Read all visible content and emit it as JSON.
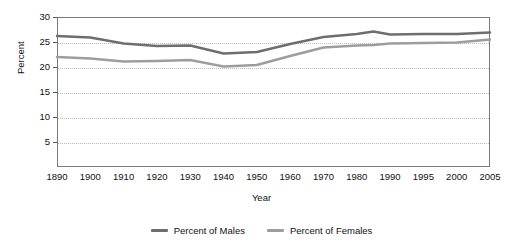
{
  "chart_data": {
    "type": "line",
    "title": "",
    "xlabel": "Year",
    "ylabel": "Percent",
    "ylim": [
      0,
      30
    ],
    "y_ticks": [
      5,
      10,
      15,
      20,
      25,
      30
    ],
    "grid": true,
    "legend_position": "bottom",
    "categories": [
      1890,
      1900,
      1910,
      1920,
      1930,
      1940,
      1950,
      1960,
      1970,
      1980,
      1990,
      1995,
      2000,
      2005
    ],
    "x_tick_labels": [
      "1890",
      "1900",
      "1910",
      "1920",
      "1930",
      "1940",
      "1950",
      "1960",
      "1970",
      "1980",
      "1990",
      "1995",
      "2000",
      "2005"
    ],
    "series": [
      {
        "name": "Percent of Males",
        "color": "#6e6e6e",
        "x": [
          1890,
          1900,
          1910,
          1920,
          1930,
          1940,
          1950,
          1960,
          1970,
          1980,
          1985,
          1990,
          1995,
          2000,
          2005
        ],
        "values": [
          26.2,
          25.9,
          24.7,
          24.2,
          24.3,
          22.7,
          23.0,
          24.6,
          26.0,
          26.6,
          27.1,
          26.5,
          26.6,
          26.6,
          26.9
        ]
      },
      {
        "name": "Percent of Females",
        "color": "#9d9d9d",
        "x": [
          1890,
          1900,
          1910,
          1920,
          1930,
          1940,
          1950,
          1960,
          1970,
          1980,
          1985,
          1990,
          1995,
          2000,
          2005
        ],
        "values": [
          22.0,
          21.7,
          21.1,
          21.2,
          21.4,
          20.1,
          20.4,
          22.2,
          23.9,
          24.3,
          24.4,
          24.7,
          24.8,
          24.9,
          25.5
        ]
      }
    ]
  },
  "legend": {
    "items": [
      {
        "label": "Percent of Males",
        "color": "#6e6e6e"
      },
      {
        "label": "Percent of Females",
        "color": "#9d9d9d"
      }
    ]
  },
  "axes": {
    "y_title": "Percent",
    "x_title": "Year"
  }
}
